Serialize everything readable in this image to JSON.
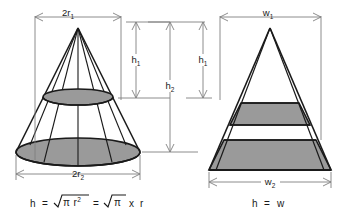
{
  "diagram": {
    "background_color": "#ffffff",
    "line_color": "#1a1a1a",
    "dimension_line_color": "#808080",
    "shading_color": "#9a9a9a"
  },
  "left_figure": {
    "name": "cone",
    "top_dimension": {
      "base": "2r",
      "sub": "1"
    },
    "bottom_dimension": {
      "base": "2r",
      "sub": "2"
    },
    "formula": {
      "lhs": "h",
      "eq1": "=",
      "radical1_inner": "π r",
      "radical1_sup": "2",
      "eq2": "=",
      "radical2_inner": "π",
      "times": "x",
      "rhs": "r",
      "full_text": "h = √(πr²) = √π x r"
    }
  },
  "right_figure": {
    "name": "pyramid",
    "top_dimension": {
      "base": "w",
      "sub": "1"
    },
    "bottom_dimension": {
      "base": "w",
      "sub": "2"
    },
    "formula": {
      "lhs": "h",
      "eq": "=",
      "rhs": "w",
      "full_text": "h = w"
    }
  },
  "height_dimensions": [
    {
      "id": "h1-left",
      "base": "h",
      "sub": "1"
    },
    {
      "id": "h2-center",
      "base": "h",
      "sub": "2"
    },
    {
      "id": "h1-right",
      "base": "h",
      "sub": "1"
    }
  ]
}
